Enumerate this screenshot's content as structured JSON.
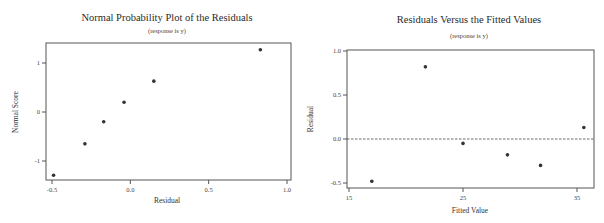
{
  "chart_data": [
    {
      "type": "scatter",
      "title": "Normal Probability Plot of the Residuals",
      "subtitle": "(response is y)",
      "xlabel": "Residual",
      "ylabel": "Normal Score",
      "xlim": [
        -0.55,
        1.05
      ],
      "ylim": [
        -1.4,
        1.4
      ],
      "xticks": [
        -0.5,
        0.0,
        0.5,
        1.0
      ],
      "xtick_labels": [
        "-0.5",
        "0.0",
        "0.5",
        "1.0"
      ],
      "yticks": [
        1,
        0,
        -1
      ],
      "ytick_labels": [
        "1",
        "0",
        "-1"
      ],
      "grid": false,
      "points": [
        {
          "x": -0.49,
          "y": -1.29
        },
        {
          "x": -0.29,
          "y": -0.65
        },
        {
          "x": -0.17,
          "y": -0.2
        },
        {
          "x": -0.04,
          "y": 0.2
        },
        {
          "x": 0.15,
          "y": 0.63
        },
        {
          "x": 0.83,
          "y": 1.27
        }
      ]
    },
    {
      "type": "scatter",
      "title": "Residuals Versus the Fitted Values",
      "subtitle": "(response is y)",
      "xlabel": "Fitted Value",
      "ylabel": "Residual",
      "xlim": [
        14.8,
        36.5
      ],
      "ylim": [
        -0.55,
        1.0
      ],
      "xticks": [
        15,
        25,
        35
      ],
      "xtick_labels": [
        "15",
        "25",
        "35"
      ],
      "yticks": [
        1.0,
        0.5,
        0.0,
        -0.5
      ],
      "ytick_labels": [
        "1.0",
        "0.5",
        "0.0",
        "-0.5"
      ],
      "grid": false,
      "reference_line": {
        "y": 0.0,
        "style": "dashed"
      },
      "points": [
        {
          "x": 17.0,
          "y": -0.48
        },
        {
          "x": 21.7,
          "y": 0.82
        },
        {
          "x": 25.0,
          "y": -0.05
        },
        {
          "x": 28.9,
          "y": -0.18
        },
        {
          "x": 31.8,
          "y": -0.3
        },
        {
          "x": 35.6,
          "y": 0.13
        }
      ]
    }
  ]
}
